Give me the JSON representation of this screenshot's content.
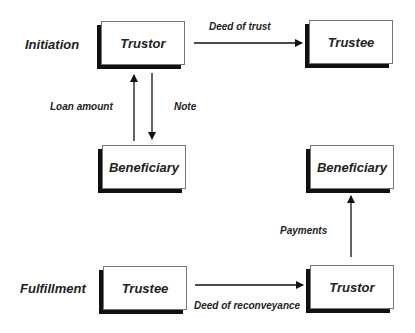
{
  "stages": {
    "initiation": "Initiation",
    "fulfillment": "Fulfillment"
  },
  "nodes": {
    "trustor_top": "Trustor",
    "trustee_top": "Trustee",
    "beneficiary_left": "Beneficiary",
    "beneficiary_right": "Beneficiary",
    "trustee_bottom": "Trustee",
    "trustor_bottom": "Trustor"
  },
  "edges": {
    "deed_of_trust": "Deed of trust",
    "loan_amount": "Loan amount",
    "note": "Note",
    "payments": "Payments",
    "deed_of_reconveyance": "Deed of reconveyance"
  }
}
